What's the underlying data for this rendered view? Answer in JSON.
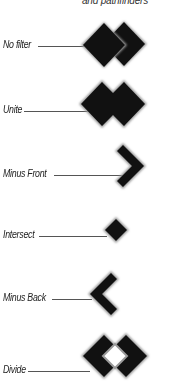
{
  "caption": "and pathfinders",
  "colors": {
    "fill": "#111111",
    "halo": "#9a9a9a",
    "leader": "#555555",
    "text": "#222222"
  },
  "items": [
    {
      "label": "No filter",
      "operation": "none"
    },
    {
      "label": "Unite",
      "operation": "unite"
    },
    {
      "label": "Minus Front",
      "operation": "minus-front"
    },
    {
      "label": "Intersect",
      "operation": "intersect"
    },
    {
      "label": "Minus Back",
      "operation": "minus-back"
    },
    {
      "label": "Divide",
      "operation": "divide"
    }
  ]
}
